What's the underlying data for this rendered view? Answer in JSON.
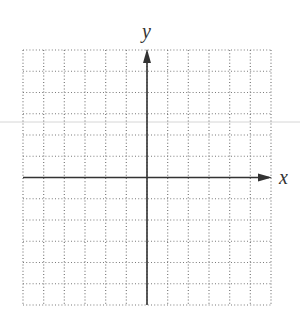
{
  "figure": {
    "type": "coordinate-plane",
    "x_axis_label": "x",
    "y_axis_label": "y",
    "grid": {
      "columns": 12,
      "rows": 12,
      "left": 23,
      "top": 50,
      "right": 271,
      "bottom": 305,
      "line_style": "dotted",
      "color": "#7a7a7a"
    },
    "axes": {
      "origin_col": 6,
      "origin_row": 6,
      "color": "#333333",
      "arrow_right": true,
      "arrow_up": true
    },
    "artifact_line": {
      "y": 122,
      "color": "#d6d6d6"
    }
  }
}
